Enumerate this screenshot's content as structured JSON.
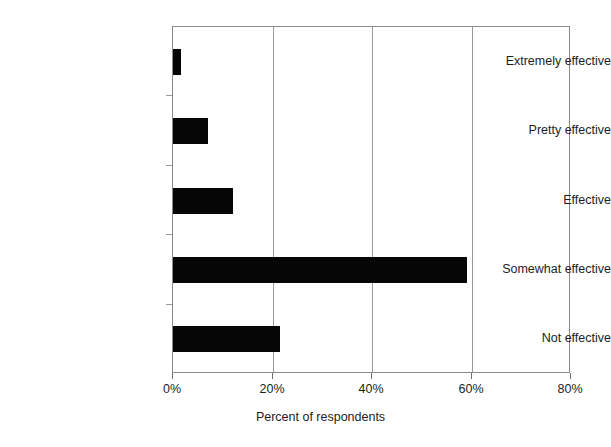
{
  "chart_data": {
    "type": "bar",
    "orientation": "horizontal",
    "title": "",
    "xlabel": "Percent of respondents",
    "ylabel": "",
    "categories": [
      "Extremely effective",
      "Pretty effective",
      "Effective",
      "Somewhat effective",
      "Not effective"
    ],
    "values": [
      1.6,
      7.0,
      12.0,
      59.0,
      21.5
    ],
    "values_display": [
      "1.6%",
      "7%",
      "12%",
      "59%",
      "21.5%"
    ],
    "xlim": [
      0,
      80
    ],
    "xticks": [
      0,
      20,
      40,
      60,
      80
    ],
    "xtick_labels": [
      "0%",
      "20%",
      "40%",
      "60%",
      "80%"
    ],
    "grid": "vertical",
    "legend": "none",
    "bar_color": "#060606",
    "grid_color": "#9b9b9b",
    "axis_color": "#8a8a8a",
    "background": "#ffffff"
  },
  "axis": {
    "x_title": "Percent of respondents"
  }
}
